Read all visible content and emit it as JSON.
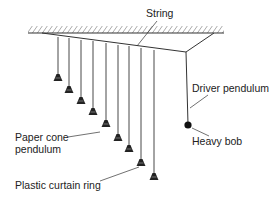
{
  "labels": {
    "string": "String",
    "driver_pendulum": "Driver pendulum",
    "heavy_bob": "Heavy bob",
    "paper_cone_line1": "Paper cone",
    "paper_cone_line2": "pendulum",
    "plastic_ring": "Plastic curtain ring"
  },
  "colors": {
    "line": "#333333",
    "fill": "#222222"
  },
  "pendulums": [
    {
      "x": 58,
      "top": 37,
      "bottom": 81
    },
    {
      "x": 69,
      "top": 38,
      "bottom": 93
    },
    {
      "x": 81,
      "top": 40,
      "bottom": 104
    },
    {
      "x": 93,
      "top": 41,
      "bottom": 115
    },
    {
      "x": 106,
      "top": 43,
      "bottom": 127
    },
    {
      "x": 118,
      "top": 45,
      "bottom": 141
    },
    {
      "x": 129,
      "top": 46,
      "bottom": 152
    },
    {
      "x": 141,
      "top": 48,
      "bottom": 166
    },
    {
      "x": 154,
      "top": 50,
      "bottom": 180
    }
  ]
}
